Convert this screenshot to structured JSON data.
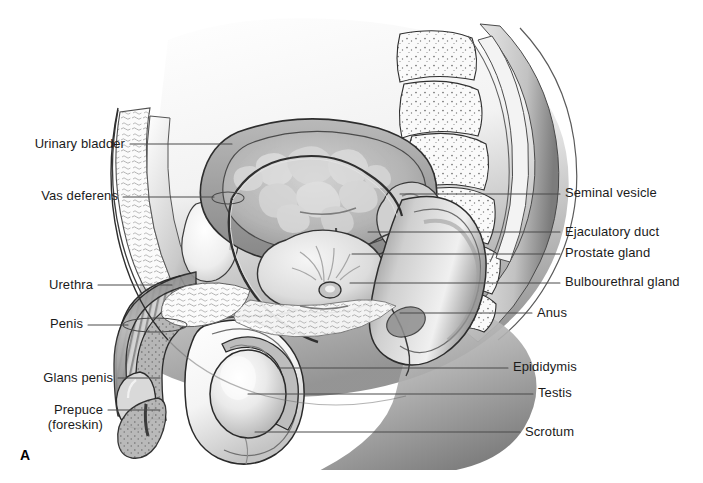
{
  "figure": {
    "panel_letter": "A",
    "background_color": "#ffffff",
    "label_color": "#1b1b1b",
    "leader_color": "#4a4a4a",
    "width": 703,
    "height": 483
  },
  "labels_left": [
    {
      "id": "urinary-bladder",
      "text": "Urinary bladder",
      "text_x": 125,
      "text_y": 148,
      "leader_x1": 130,
      "leader_y1": 144,
      "leader_x2": 232,
      "leader_y2": 144,
      "pointer": "line"
    },
    {
      "id": "vas-deferens",
      "text": "Vas deferens",
      "text_x": 118,
      "text_y": 200,
      "leader_x1": 123,
      "leader_y1": 197,
      "leader_x2": 214,
      "leader_y2": 197,
      "pointer": "ellipse",
      "ellipse_cx": 228,
      "ellipse_cy": 198,
      "ellipse_rx": 16,
      "ellipse_ry": 6
    },
    {
      "id": "urethra",
      "text": "Urethra",
      "text_x": 93,
      "text_y": 289,
      "leader_x1": 98,
      "leader_y1": 285,
      "leader_x2": 172,
      "leader_y2": 285,
      "pointer": "line"
    },
    {
      "id": "penis",
      "text": "Penis",
      "text_x": 83,
      "text_y": 328,
      "leader_x1": 88,
      "leader_y1": 325,
      "leader_x2": 128,
      "leader_y2": 325,
      "pointer": "ellipse",
      "ellipse_cx": 155,
      "ellipse_cy": 325,
      "ellipse_rx": 32,
      "ellipse_ry": 7
    },
    {
      "id": "glans-penis",
      "text": "Glans penis",
      "text_x": 113,
      "text_y": 382,
      "leader_x1": 118,
      "leader_y1": 378,
      "leader_x2": 160,
      "leader_y2": 378,
      "pointer": "line"
    },
    {
      "id": "prepuce",
      "text": "Prepuce",
      "text_line2": "(foreskin)",
      "text_x": 103,
      "text_y": 414,
      "leader_x1": 108,
      "leader_y1": 410,
      "leader_x2": 160,
      "leader_y2": 410,
      "pointer": "line"
    }
  ],
  "labels_right": [
    {
      "id": "seminal-vesicle",
      "text": "Seminal vesicle",
      "text_x": 565,
      "text_y": 197,
      "leader_x1": 400,
      "leader_y1": 194,
      "leader_x2": 560,
      "leader_y2": 194,
      "pointer": "line"
    },
    {
      "id": "ejaculatory-duct",
      "text": "Ejaculatory duct",
      "text_x": 565,
      "text_y": 236,
      "leader_x1": 368,
      "leader_y1": 232,
      "leader_x2": 560,
      "leader_y2": 232,
      "pointer": "line"
    },
    {
      "id": "prostate-gland",
      "text": "Prostate gland",
      "text_x": 565,
      "text_y": 257,
      "leader_x1": 352,
      "leader_y1": 254,
      "leader_x2": 560,
      "leader_y2": 254,
      "pointer": "line"
    },
    {
      "id": "bulbourethral-gland",
      "text": "Bulbourethral gland",
      "text_x": 565,
      "text_y": 286,
      "leader_x1": 350,
      "leader_y1": 283,
      "leader_x2": 560,
      "leader_y2": 283,
      "pointer": "line"
    },
    {
      "id": "anus",
      "text": "Anus",
      "text_x": 537,
      "text_y": 317,
      "leader_x1": 400,
      "leader_y1": 313,
      "leader_x2": 532,
      "leader_y2": 313,
      "pointer": "line"
    },
    {
      "id": "epididymis",
      "text": "Epididymis",
      "text_x": 513,
      "text_y": 371,
      "leader_x1": 278,
      "leader_y1": 368,
      "leader_x2": 508,
      "leader_y2": 368,
      "pointer": "line"
    },
    {
      "id": "testis",
      "text": "Testis",
      "text_x": 538,
      "text_y": 397,
      "leader_x1": 248,
      "leader_y1": 394,
      "leader_x2": 533,
      "leader_y2": 394,
      "pointer": "line"
    },
    {
      "id": "scrotum",
      "text": "Scrotum",
      "text_x": 525,
      "text_y": 436,
      "leader_x1": 255,
      "leader_y1": 432,
      "leader_x2": 520,
      "leader_y2": 432,
      "pointer": "line"
    }
  ],
  "anatomy": {
    "title": "Male reproductive system, midsagittal section",
    "structures": [
      "abdominal wall",
      "urinary bladder",
      "pubic bone",
      "sacrum",
      "rectum",
      "prostate gland",
      "seminal vesicle",
      "ejaculatory duct",
      "bulbourethral gland",
      "vas deferens",
      "epididymis",
      "testis",
      "scrotum",
      "penis shaft",
      "corpus cavernosum",
      "glans penis",
      "prepuce",
      "urethra",
      "anus"
    ],
    "palette": {
      "outline": "#2b2b2b",
      "mid_gray": "#9a9a9a",
      "light_gray": "#d8d8d8",
      "dark_gray": "#5c5c5c",
      "deep_shadow": "#3a3a3a",
      "tissue_fill": "#efefef",
      "cavity_fill": "#c7c7c7"
    }
  }
}
